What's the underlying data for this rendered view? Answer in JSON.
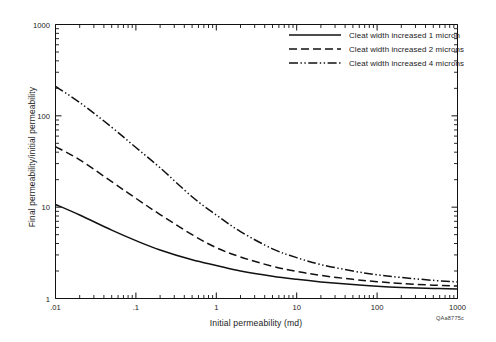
{
  "figure": {
    "id_label": "QAa8775c",
    "background": "#ffffff",
    "line_color": "#111111"
  },
  "chart_data": {
    "type": "line",
    "title": "",
    "xlabel": "Initial permeability (md)",
    "ylabel": "Final permeability/initial permeability",
    "xscale": "log",
    "yscale": "log",
    "xlim": [
      0.01,
      1000
    ],
    "ylim": [
      1,
      1000
    ],
    "grid": false,
    "xticklabels": [
      ".01",
      ".1",
      "1",
      "10",
      "100",
      "1000"
    ],
    "xtickvalues": [
      0.01,
      0.1,
      1,
      10,
      100,
      1000
    ],
    "yticklabels": [
      "1",
      "10",
      "100",
      "1000"
    ],
    "ytickvalues": [
      1,
      10,
      100,
      1000
    ],
    "legend_position": "top-right",
    "x": [
      0.01,
      0.02,
      0.05,
      0.1,
      0.2,
      0.5,
      1,
      2,
      5,
      10,
      20,
      50,
      100,
      200,
      500,
      1000
    ],
    "series": [
      {
        "name": "Cleat width increased 1 micron",
        "style": "solid",
        "values": [
          10.7,
          8.2,
          5.6,
          4.3,
          3.4,
          2.65,
          2.3,
          2.0,
          1.75,
          1.62,
          1.52,
          1.42,
          1.36,
          1.32,
          1.29,
          1.27
        ]
      },
      {
        "name": "Cleat width increased 2 microns",
        "style": "dashed",
        "values": [
          46.0,
          33.0,
          19.0,
          12.5,
          8.3,
          5.0,
          3.6,
          2.85,
          2.25,
          1.98,
          1.79,
          1.62,
          1.53,
          1.46,
          1.4,
          1.37
        ]
      },
      {
        "name": "Cleat width increased 4 microns",
        "style": "dash-dot-dot",
        "values": [
          210.0,
          140.0,
          75.0,
          45.0,
          27.0,
          13.0,
          8.2,
          5.4,
          3.5,
          2.8,
          2.35,
          2.0,
          1.82,
          1.7,
          1.58,
          1.52
        ]
      }
    ]
  },
  "legend": {
    "items": [
      {
        "label": "Cleat width increased 1 micron",
        "style": "solid"
      },
      {
        "label": "Cleat width increased 2 microns",
        "style": "dashed"
      },
      {
        "label": "Cleat width increased 4 microns",
        "style": "dash-dot-dot"
      }
    ]
  }
}
